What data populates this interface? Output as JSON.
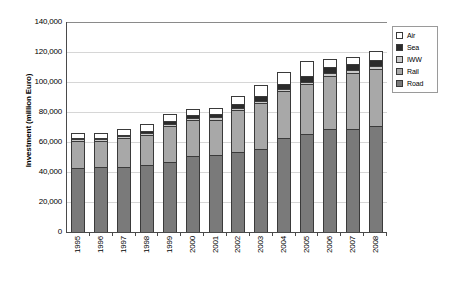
{
  "chart_data": {
    "type": "bar",
    "title": "",
    "subtitle": "",
    "xlabel": "",
    "ylabel": "Investment (million Euro)",
    "ylim": [
      0,
      140000
    ],
    "ytick_step": 20000,
    "ytick_labels": [
      "0",
      "20,000",
      "40,000",
      "60,000",
      "80,000",
      "100,000",
      "120,000",
      "140,000"
    ],
    "ytick_values": [
      0,
      20000,
      40000,
      60000,
      80000,
      100000,
      120000,
      140000
    ],
    "grid": true,
    "grid_axis": "y",
    "stacked": true,
    "legend_position": "right-top",
    "categories": [
      "1995",
      "1996",
      "1997",
      "1998",
      "1999",
      "2000",
      "2001",
      "2002",
      "2003",
      "2004",
      "2005",
      "2006",
      "2007",
      "2008"
    ],
    "series": [
      {
        "name": "Road",
        "color": "#7a7a7a",
        "values": [
          43000,
          43500,
          43500,
          45000,
          46500,
          51000,
          51500,
          53500,
          55500,
          62500,
          65500,
          68500,
          69000,
          70500
        ]
      },
      {
        "name": "Rail",
        "color": "#a8a8a8",
        "values": [
          17500,
          17000,
          19000,
          19500,
          24000,
          23500,
          23500,
          28000,
          30500,
          31500,
          33000,
          35500,
          37000,
          38500
        ]
      },
      {
        "name": "IWW",
        "color": "#c9c9c9",
        "values": [
          1200,
          1200,
          1200,
          1300,
          1300,
          1400,
          1400,
          1500,
          1500,
          1600,
          1700,
          1700,
          1800,
          1800
        ]
      },
      {
        "name": "Sea",
        "color": "#2b2b2b",
        "values": [
          1300,
          1300,
          1300,
          1700,
          2000,
          2100,
          2100,
          2500,
          3000,
          3400,
          3800,
          4300,
          4200,
          4200
        ]
      },
      {
        "name": "Air",
        "color": "#ffffff",
        "values": [
          3000,
          3000,
          3500,
          4500,
          5200,
          4000,
          4500,
          5500,
          7500,
          8000,
          10000,
          5500,
          5000,
          6000
        ]
      }
    ],
    "totals": [
      66000,
      66000,
      68500,
      72000,
      79000,
      82000,
      83000,
      91000,
      98000,
      107000,
      114000,
      115500,
      117000,
      121000
    ]
  },
  "legend": {
    "items": [
      {
        "label": "Air",
        "color": "#ffffff"
      },
      {
        "label": "Sea",
        "color": "#2b2b2b"
      },
      {
        "label": "IWW",
        "color": "#c9c9c9"
      },
      {
        "label": "Rail",
        "color": "#a8a8a8"
      },
      {
        "label": "Road",
        "color": "#7a7a7a"
      }
    ]
  }
}
